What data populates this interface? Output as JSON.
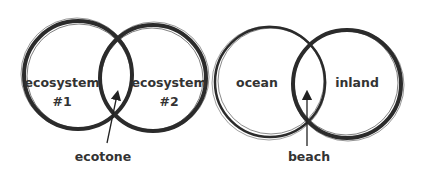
{
  "diagram": {
    "left": {
      "circles": [
        {
          "label_line1": "ecosystem",
          "label_line2": "#1"
        },
        {
          "label_line1": "ecosystem",
          "label_line2": "#2"
        }
      ],
      "overlap_label": "ecotone"
    },
    "right": {
      "circles": [
        {
          "label_line1": "ocean"
        },
        {
          "label_line1": "inland"
        }
      ],
      "overlap_label": "beach"
    },
    "colors": {
      "stroke": "#2b2b2b",
      "text": "#333333",
      "background": "#ffffff"
    }
  }
}
